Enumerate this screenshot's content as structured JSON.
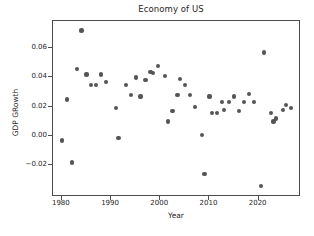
{
  "chart_data": {
    "type": "scatter",
    "title": "Economy of US",
    "xlabel": "Year",
    "ylabel": "GDP GRowth",
    "grid": false,
    "legend": null,
    "marker_color": "#555555",
    "xlim": [
      1978.2,
      1979.0
    ],
    "axis_ranges": {
      "xlim": [
        1978.2,
        1979.0
      ],
      "ylim": [
        -0.041,
        0.079
      ]
    },
    "xticks": [
      1980,
      1990,
      2000,
      2010,
      2020
    ],
    "yticks": [
      -0.02,
      0.0,
      0.02,
      0.04,
      0.06
    ],
    "ytick_labels": [
      "−0.02",
      "0.00",
      "0.02",
      "0.04",
      "0.06"
    ],
    "xtick_labels": [
      "1980",
      "1990",
      "2000",
      "2010",
      "2020"
    ],
    "x": [
      1980,
      1981,
      1982,
      1983,
      1984,
      1985,
      1986,
      1987,
      1988,
      1989,
      1990,
      1991,
      1992,
      1993,
      1994,
      1995,
      1996,
      1997,
      1998,
      1999,
      2000,
      2001,
      2002,
      2003,
      2004,
      2005,
      2006,
      2007,
      2008,
      2009,
      2010,
      2011,
      2012,
      2013,
      2014,
      2015,
      2016,
      2017,
      2018,
      2019,
      2020,
      2021,
      2022,
      2023,
      2024,
      2025,
      2026
    ],
    "y": [
      -0.003,
      0.025,
      -0.018,
      0.046,
      0.072,
      0.042,
      0.035,
      0.035,
      0.042,
      0.037,
      0.019,
      -0.001,
      0.035,
      0.028,
      0.04,
      0.027,
      0.038,
      0.044,
      0.043,
      0.048,
      0.041,
      0.01,
      0.017,
      0.028,
      0.039,
      0.035,
      0.028,
      0.02,
      0.001,
      -0.026,
      0.027,
      0.016,
      0.023,
      0.018,
      0.023,
      0.027,
      0.017,
      0.023,
      0.029,
      0.023,
      -0.034,
      0.057,
      0.016,
      0.01,
      0.012,
      0.018,
      0.021,
      0.019
    ],
    "points": [
      {
        "year": 1980,
        "value": -0.003
      },
      {
        "year": 1981,
        "value": 0.025
      },
      {
        "year": 1982,
        "value": -0.018
      },
      {
        "year": 1983,
        "value": 0.046
      },
      {
        "year": 1984,
        "value": 0.072
      },
      {
        "year": 1985,
        "value": 0.042
      },
      {
        "year": 1986,
        "value": 0.035
      },
      {
        "year": 1987,
        "value": 0.035
      },
      {
        "year": 1988,
        "value": 0.042
      },
      {
        "year": 1989,
        "value": 0.037
      },
      {
        "year": 1991,
        "value": 0.019
      },
      {
        "year": 1991.5,
        "value": -0.001
      },
      {
        "year": 1993,
        "value": 0.035
      },
      {
        "year": 1994,
        "value": 0.028
      },
      {
        "year": 1995,
        "value": 0.04
      },
      {
        "year": 1996,
        "value": 0.027
      },
      {
        "year": 1997,
        "value": 0.038
      },
      {
        "year": 1998,
        "value": 0.044
      },
      {
        "year": 1998.5,
        "value": 0.043
      },
      {
        "year": 1999.5,
        "value": 0.048
      },
      {
        "year": 2001,
        "value": 0.041
      },
      {
        "year": 2001.5,
        "value": 0.01
      },
      {
        "year": 2002.5,
        "value": 0.017
      },
      {
        "year": 2003.5,
        "value": 0.028
      },
      {
        "year": 2004,
        "value": 0.039
      },
      {
        "year": 2005,
        "value": 0.035
      },
      {
        "year": 2006,
        "value": 0.028
      },
      {
        "year": 2007,
        "value": 0.02
      },
      {
        "year": 2008.5,
        "value": 0.001
      },
      {
        "year": 2009,
        "value": -0.026
      },
      {
        "year": 2010,
        "value": 0.027
      },
      {
        "year": 2010.5,
        "value": 0.016
      },
      {
        "year": 2011.5,
        "value": 0.016
      },
      {
        "year": 2012.5,
        "value": 0.023
      },
      {
        "year": 2013,
        "value": 0.018
      },
      {
        "year": 2014,
        "value": 0.023
      },
      {
        "year": 2015,
        "value": 0.027
      },
      {
        "year": 2016,
        "value": 0.017
      },
      {
        "year": 2017,
        "value": 0.023
      },
      {
        "year": 2018,
        "value": 0.029
      },
      {
        "year": 2019,
        "value": 0.023
      },
      {
        "year": 2020.5,
        "value": -0.034
      },
      {
        "year": 2021,
        "value": 0.057
      },
      {
        "year": 2022.5,
        "value": 0.016
      },
      {
        "year": 2023,
        "value": 0.01
      },
      {
        "year": 2023.5,
        "value": 0.012
      },
      {
        "year": 2025,
        "value": 0.018
      },
      {
        "year": 2025.5,
        "value": 0.021
      },
      {
        "year": 2026.5,
        "value": 0.019
      }
    ]
  }
}
